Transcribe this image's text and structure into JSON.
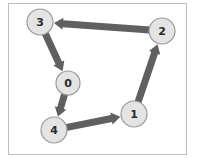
{
  "diagram": {
    "type": "directed-graph",
    "frame": {
      "x": 8,
      "y": 3,
      "width": 178,
      "height": 151,
      "stroke": "#bdbdbd"
    },
    "colors": {
      "node_fill": "#e4e4e4",
      "node_stroke": "#9a9a9a",
      "edge": "#606060",
      "label": "#2a2a2a"
    },
    "nodes": [
      {
        "id": "0",
        "label": "0",
        "cx": 68,
        "cy": 83,
        "r": 12
      },
      {
        "id": "1",
        "label": "1",
        "cx": 134,
        "cy": 114,
        "r": 13
      },
      {
        "id": "2",
        "label": "2",
        "cx": 162,
        "cy": 31,
        "r": 13
      },
      {
        "id": "3",
        "label": "3",
        "cx": 40,
        "cy": 22,
        "r": 13
      },
      {
        "id": "4",
        "label": "4",
        "cx": 54,
        "cy": 130,
        "r": 13
      }
    ],
    "edges": [
      {
        "from": "2",
        "to": "3"
      },
      {
        "from": "3",
        "to": "0"
      },
      {
        "from": "0",
        "to": "4"
      },
      {
        "from": "4",
        "to": "1"
      },
      {
        "from": "1",
        "to": "2"
      }
    ]
  }
}
